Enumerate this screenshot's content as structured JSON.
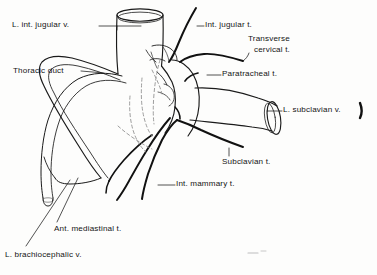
{
  "figure": {
    "type": "anatomical-line-drawing",
    "background_color": "#fdfdfc",
    "ink_color": "#141414",
    "labels": [
      {
        "id": "l-int-jugular-v",
        "text": "L. int. jugular v.",
        "x": 12,
        "y": 22,
        "leader": "horizontal-right"
      },
      {
        "id": "int-jugular-t",
        "text": "Int. jugular t.",
        "x": 205,
        "y": 22,
        "leader": "horizontal-left"
      },
      {
        "id": "transverse-cervical-t",
        "text": "Transverse cervical t.",
        "line1": "Transverse",
        "line2": "cervical t.",
        "x": 248,
        "y": 40,
        "leader": "diagonal-left-down"
      },
      {
        "id": "thoracic-duct",
        "text": "Thoracic duct",
        "x": 13,
        "y": 68,
        "leader": "horizontal-right"
      },
      {
        "id": "paratracheal-t",
        "text": "Paratracheal t.",
        "x": 222,
        "y": 71,
        "leader": "horizontal-left"
      },
      {
        "id": "l-subclavian-v",
        "text": "L. subclavian v.",
        "x": 283,
        "y": 107,
        "leader": "horizontal-left"
      },
      {
        "id": "subclavian-t",
        "text": "Subclavian t.",
        "x": 222,
        "y": 159,
        "leader": "vertical-up"
      },
      {
        "id": "int-mammary-t",
        "text": "Int. mammary t.",
        "x": 176,
        "y": 181,
        "leader": "horizontal-left"
      },
      {
        "id": "ant-mediastinal-t",
        "text": "Ant. mediastinal t.",
        "x": 54,
        "y": 226,
        "leader": "diagonal-up-left"
      },
      {
        "id": "l-brachiocephalic-v",
        "text": "L. brachiocephalic v.",
        "x": 5,
        "y": 252,
        "leader": "diagonal-up-right"
      }
    ],
    "structures": [
      {
        "id": "internal-jugular-vein",
        "kind": "vein-tube",
        "orientation": "vertical"
      },
      {
        "id": "subclavian-vein",
        "kind": "vein-tube",
        "orientation": "diagonal-right"
      },
      {
        "id": "brachiocephalic-vein",
        "kind": "vein-tube",
        "orientation": "diagonal-lower-left"
      },
      {
        "id": "thoracic-duct-vessel",
        "kind": "duct",
        "orientation": "diagonal-lower-left"
      },
      {
        "id": "internal-jugular-trunk",
        "kind": "lymph-trunk"
      },
      {
        "id": "transverse-cervical-trunk",
        "kind": "lymph-trunk"
      },
      {
        "id": "paratracheal-trunk",
        "kind": "lymph-trunk"
      },
      {
        "id": "subclavian-trunk",
        "kind": "lymph-trunk"
      },
      {
        "id": "internal-mammary-trunk",
        "kind": "lymph-trunk"
      },
      {
        "id": "anterior-mediastinal-trunk",
        "kind": "lymph-trunk"
      },
      {
        "id": "hidden-vessels",
        "kind": "dashed-hidden-lines"
      },
      {
        "id": "corner-mark",
        "kind": "stray-ink-mark"
      }
    ]
  }
}
